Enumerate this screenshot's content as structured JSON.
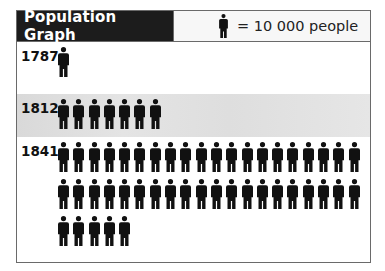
{
  "header": {
    "title": "Population Graph",
    "legend_label": "= 10 000 people",
    "legend_icon": "person-icon"
  },
  "colors": {
    "header_dark": "#1c1c1c",
    "band_gray": "#e0e0e0",
    "figure": "#111111"
  },
  "rows": [
    {
      "year": "1787",
      "figures": 1
    },
    {
      "year": "1812",
      "figures": 7
    },
    {
      "year": "1841",
      "figures": 45
    }
  ],
  "chart_data": {
    "type": "bar",
    "title": "Population Graph",
    "unit_note": "Each figure = 10 000 people",
    "categories": [
      "1787",
      "1812",
      "1841"
    ],
    "values": [
      10000,
      70000,
      450000
    ],
    "figure_counts": [
      1,
      7,
      45
    ],
    "xlabel": "",
    "ylabel": "Population",
    "orientation": "horizontal pictograph"
  }
}
